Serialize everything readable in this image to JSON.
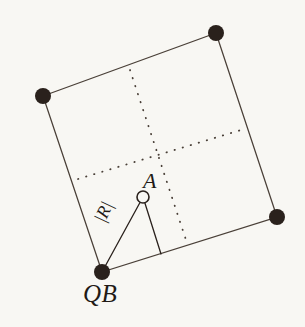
{
  "figure": {
    "title": "",
    "background_color": "#f8f7f3",
    "ink_color": "#2a211c",
    "line_color": "#4a4038",
    "labels": {
      "corner_bottom_left": "QB",
      "point_a": "A",
      "radius": "|R|"
    },
    "square": {
      "description": "rotated square with four filled corner markers",
      "corners": [
        {
          "name": "top-left",
          "x": 43,
          "y": 96
        },
        {
          "name": "top-right",
          "x": 216,
          "y": 33
        },
        {
          "name": "bottom-right",
          "x": 277,
          "y": 217
        },
        {
          "name": "bottom-left",
          "x": 102,
          "y": 272
        }
      ],
      "marker_radius": 8,
      "marker_fill": "#2a211c",
      "edge_width": 1.3
    },
    "dotted_cross": {
      "style": "dotted",
      "vertical": {
        "x1": 130,
        "y1": 70,
        "x2": 187,
        "y2": 243
      },
      "horizontal": {
        "x1": 78,
        "y1": 179,
        "x2": 241,
        "y2": 130
      }
    },
    "point_a": {
      "x": 143,
      "y": 197,
      "radius": 6,
      "fill": "#f8f7f3",
      "stroke": "#2a211c",
      "marker": "open-circle"
    },
    "triangle": {
      "vertices": [
        {
          "name": "A",
          "x": 143,
          "y": 197
        },
        {
          "name": "QB",
          "x": 102,
          "y": 272
        },
        {
          "name": "foot",
          "x": 161,
          "y": 254
        }
      ],
      "edges": [
        {
          "from": "A",
          "to": "QB",
          "label": "|R|"
        },
        {
          "from": "A",
          "to": "foot",
          "label": ""
        }
      ]
    }
  }
}
